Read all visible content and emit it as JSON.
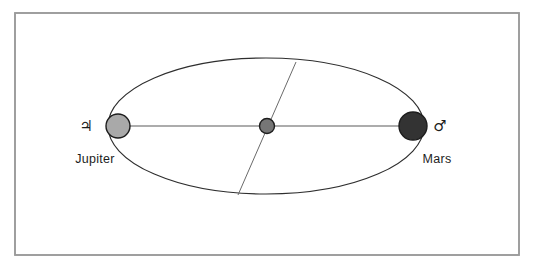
{
  "figure": {
    "background_color": "#ffffff",
    "frame": {
      "name": "figure-border",
      "stroke_color": "#9b9b9b",
      "x": 15,
      "y": 13,
      "width": 504,
      "height": 242
    },
    "orbit": {
      "name": "orbit-ellipse",
      "stroke_color": "#2e2e2e",
      "center_x": 266,
      "center_y": 126,
      "radius_x": 158,
      "radius_y": 68
    },
    "major_axis": {
      "name": "major-axis-line",
      "stroke_color": "#5a5a5a",
      "x1": 118,
      "y1": 126,
      "x2": 412,
      "y2": 126
    },
    "chord": {
      "name": "chord-line",
      "stroke_color": "#6a6a6a",
      "x1": 296,
      "y1": 62,
      "x2": 238,
      "y2": 195
    },
    "bodies": [
      {
        "id": "jupiter",
        "label": "Jupiter",
        "symbol": "♃",
        "symbol_name": "jupiter-symbol",
        "fill_color": "#a9a9a9",
        "stroke_color": "#1d1d1d",
        "cx": 118,
        "cy": 126,
        "r": 12,
        "label_x": 95,
        "label_y": 160,
        "symbol_x": 86,
        "symbol_y": 131
      },
      {
        "id": "center-body",
        "label": "",
        "symbol": "",
        "symbol_name": "center-body-marker",
        "fill_color": "#767676",
        "stroke_color": "#1d1d1d",
        "cx": 267,
        "cy": 126,
        "r": 7.5,
        "label_x": 0,
        "label_y": 0,
        "symbol_x": 0,
        "symbol_y": 0
      },
      {
        "id": "mars",
        "label": "Mars",
        "symbol": "♂",
        "symbol_name": "mars-symbol",
        "fill_color": "#333333",
        "stroke_color": "#1d1d1d",
        "cx": 413,
        "cy": 126,
        "r": 14,
        "label_x": 420,
        "label_y": 160,
        "symbol_x": 434,
        "symbol_y": 131
      }
    ]
  }
}
